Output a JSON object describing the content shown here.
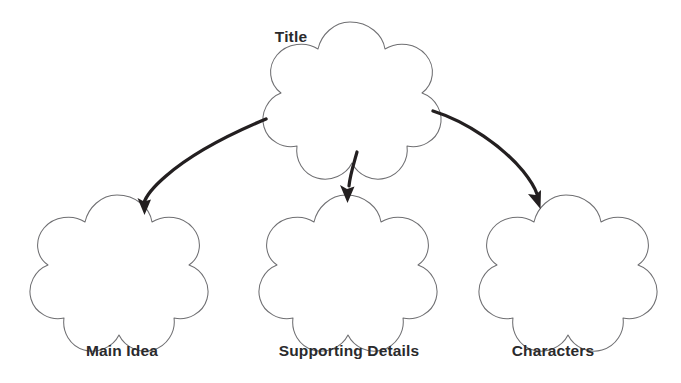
{
  "diagram": {
    "kind": "graphic-organizer",
    "layout": "one-top-node-with-three-child-nodes",
    "background_color": "#ffffff",
    "shape_style": {
      "name": "five-lobed-cloud",
      "fill": "#ffffff",
      "stroke": "#6f6f72"
    },
    "connector_style": {
      "name": "curved-arrow",
      "color": "#231f20"
    },
    "label_color": "#2a2a2c",
    "nodes": [
      {
        "id": "title",
        "label": "Title",
        "label_position": "above-left",
        "shape": "five-lobed-cloud"
      },
      {
        "id": "main-idea",
        "label": "Main Idea",
        "label_position": "below",
        "shape": "five-lobed-cloud"
      },
      {
        "id": "supporting-details",
        "label": "Supporting Details",
        "label_position": "below",
        "shape": "five-lobed-cloud"
      },
      {
        "id": "characters",
        "label": "Characters",
        "label_position": "below",
        "shape": "five-lobed-cloud"
      }
    ],
    "connectors": [
      {
        "id": "title-to-main-idea",
        "from": "title",
        "to": "main-idea",
        "direction": "down-left"
      },
      {
        "id": "title-to-supporting-details",
        "from": "title",
        "to": "supporting-details",
        "direction": "down"
      },
      {
        "id": "title-to-characters",
        "from": "title",
        "to": "characters",
        "direction": "down-right"
      }
    ]
  }
}
